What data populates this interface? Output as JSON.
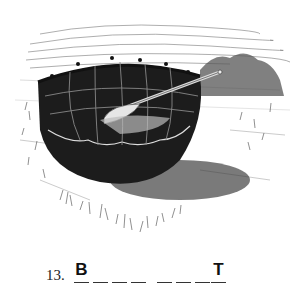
{
  "illustration": {
    "subject": "bull boat",
    "description": "Round hide-covered boat with wooden paddle resting on a grassy field, hills in the background"
  },
  "puzzle": {
    "number": "13.",
    "words": [
      {
        "letters": [
          "B",
          "",
          "",
          ""
        ]
      },
      {
        "letters": [
          "",
          "",
          "",
          "T"
        ]
      }
    ]
  }
}
